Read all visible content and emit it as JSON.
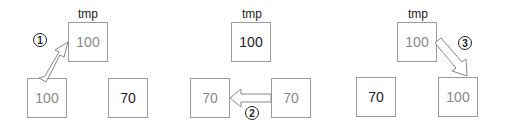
{
  "panels": [
    {
      "tmp_label": "tmp",
      "tmp_value": "100",
      "left_value": "100",
      "right_value": "70",
      "step": "1"
    },
    {
      "tmp_label": "tmp",
      "tmp_value": "100",
      "left_value": "70",
      "right_value": "70",
      "step": "2"
    },
    {
      "tmp_label": "tmp",
      "tmp_value": "100",
      "left_value": "70",
      "right_value": "100",
      "step": "3"
    }
  ],
  "colors": {
    "border": "#9a9a9a",
    "dim_text": "#888888",
    "dark_text": "#222222"
  }
}
